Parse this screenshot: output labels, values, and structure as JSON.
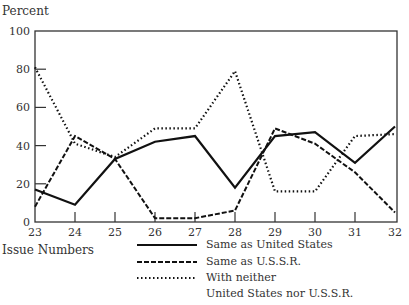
{
  "chart_data": {
    "type": "line",
    "title": "",
    "ylabel": "Percent",
    "xlabel": "Issue Numbers",
    "ylim": [
      0,
      100
    ],
    "yticks": [
      0,
      20,
      40,
      60,
      80,
      100
    ],
    "x": [
      23,
      24,
      25,
      26,
      27,
      28,
      29,
      30,
      31,
      32
    ],
    "grid": false,
    "legend_position": "bottom-right, below plot",
    "series": [
      {
        "name": "Same as United States",
        "style": "solid",
        "values": [
          17,
          9,
          33,
          42,
          45,
          18,
          45,
          47,
          31,
          50
        ]
      },
      {
        "name": "Same as U.S.S.R.",
        "style": "dashed",
        "values": [
          8,
          45,
          33,
          2,
          2,
          6,
          49,
          41,
          26,
          5
        ]
      },
      {
        "name": "With neither United States nor U.S.S.R.",
        "style": "dotted",
        "values": [
          81,
          41,
          34,
          49,
          49,
          79,
          16,
          16,
          45,
          46
        ]
      }
    ]
  },
  "axis": {
    "y_title": "Percent",
    "x_title": "Issue Numbers",
    "y_tick_labels": [
      "100",
      "80",
      "60",
      "40",
      "20",
      "0"
    ],
    "x_tick_labels": [
      "23",
      "24",
      "25",
      "26",
      "27",
      "28",
      "29",
      "30",
      "31",
      "32"
    ]
  },
  "legend": {
    "items": [
      {
        "label": "Same as United States"
      },
      {
        "label": "Same as U.S.S.R."
      },
      {
        "label": "With neither"
      }
    ],
    "continuation": "United States nor U.S.S.R."
  }
}
